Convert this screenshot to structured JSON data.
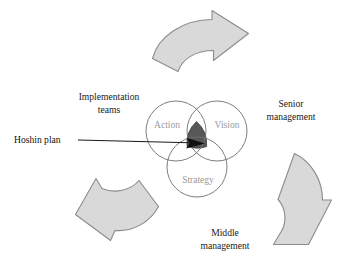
{
  "figure": {
    "name": "hoshin-planning-cycle-venn-diagram",
    "background_color": "#ffffff"
  },
  "venn": {
    "circles": [
      {
        "id": "action",
        "label": "Action",
        "cx": 176,
        "cy": 131,
        "r": 30
      },
      {
        "id": "vision",
        "label": "Vision",
        "cx": 217,
        "cy": 131,
        "r": 30
      },
      {
        "id": "strategy",
        "label": "Strategy",
        "cx": 197,
        "cy": 167,
        "r": 30
      }
    ],
    "label_color": "#9a9a9a",
    "outline_color": "#6f6f6f",
    "core": {
      "id": "hoshin-core",
      "fill": "#585858",
      "stroke": "#3a3a3a"
    }
  },
  "callout": {
    "label": "Hoshin plan",
    "text_x": 14,
    "text_y": 143,
    "line_from_x": 78,
    "line_from_y": 140,
    "line_to_x": 192,
    "line_to_y": 143,
    "color": "#101010"
  },
  "outer_labels": [
    {
      "id": "implementation-teams",
      "lines": [
        "Implementation",
        "teams"
      ],
      "x": 109,
      "y": 100,
      "line_height": 12.5
    },
    {
      "id": "senior-management",
      "lines": [
        "Senior",
        "management"
      ],
      "x": 291,
      "y": 107,
      "line_height": 12.5
    },
    {
      "id": "middle-management",
      "lines": [
        "Middle",
        "management"
      ],
      "x": 225,
      "y": 236,
      "line_height": 12.5
    }
  ],
  "arrows": [
    {
      "id": "arrow-top-to-senior-management",
      "direction": "clockwise-top",
      "fill": "#d9d9d9",
      "stroke": "#8c8c8c",
      "path": "M 152.5 58.5 C 158 36.5 183 19.5 212 19.5 L 212 10.5 L 248.5 33.5 L 213.5 60.5 L 213.5 50.5 C 196 50.5 182.5 58.5 178 71.5 Z"
    },
    {
      "id": "arrow-right-to-middle-management",
      "direction": "clockwise-right",
      "fill": "#d9d9d9",
      "stroke": "#8c8c8c",
      "path": "M 294.5 153.5 C 312 162 322.5 180.5 322.5 200 L 331.5 200 L 308.5 244.5 L 273.5 244.5 L 281.5 231 C 287 222 286 208 278 199.5 Z"
    },
    {
      "id": "arrow-bottom-left-to-implementation-teams",
      "direction": "clockwise-bottom-left",
      "fill": "#d9d9d9",
      "stroke": "#8c8c8c",
      "path": "M 158.5 206.5 C 150.5 222 133 232 115 230.5 L 110.5 240.5 L 75.5 214.5 L 96 178.5 L 102 188.5 C 115 194 130.5 190.5 139 180.5 Z"
    }
  ]
}
